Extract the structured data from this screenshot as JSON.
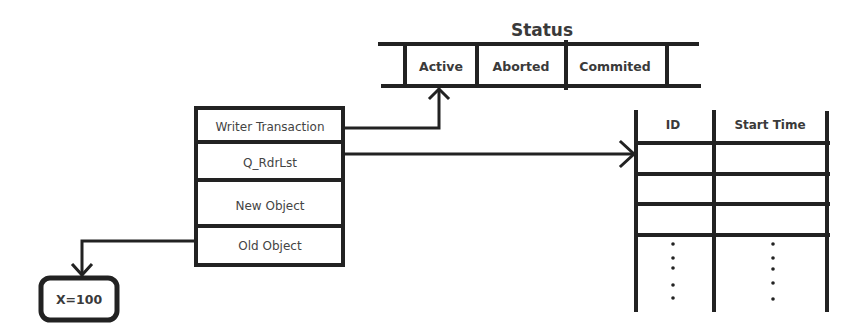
{
  "colors": {
    "line": "#222222",
    "text": "#3a3a3a",
    "background": "#ffffff"
  },
  "status": {
    "title": "Status",
    "cells": [
      "Active",
      "Aborted",
      "Commited"
    ]
  },
  "writer_box": {
    "fields": [
      "Writer Transaction",
      "Q_RdrLst",
      "New Object",
      "Old Object"
    ]
  },
  "reader_table": {
    "headers": [
      "ID",
      "Start Time"
    ],
    "row_count_visible": 3,
    "continuation": "⋮"
  },
  "value_box": {
    "label": "X=100"
  },
  "arrows": [
    {
      "from": "Writer Transaction",
      "to": "Status.Active"
    },
    {
      "from": "Q_RdrLst",
      "to": "Reader Table"
    },
    {
      "from": "Old Object",
      "to": "X=100"
    }
  ]
}
